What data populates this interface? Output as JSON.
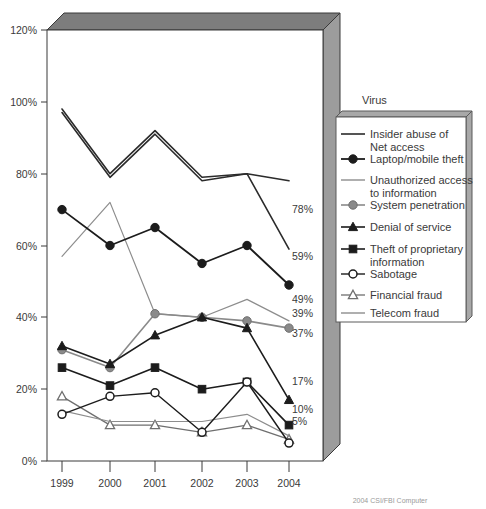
{
  "chart_data": {
    "type": "line",
    "title": "",
    "xlabel": "",
    "ylabel": "",
    "categories": [
      "1999",
      "2000",
      "2001",
      "2002",
      "2003",
      "2004"
    ],
    "ylim": [
      0,
      120
    ],
    "yticks": [
      0,
      20,
      40,
      60,
      80,
      100,
      120
    ],
    "ytick_labels": [
      "0%",
      "20%",
      "40%",
      "60%",
      "80%",
      "100%",
      "120%"
    ],
    "grid": false,
    "legend_position": "right",
    "legend_title": "Virus",
    "series": [
      {
        "name": "Virus",
        "values": [
          98,
          80,
          92,
          79,
          80,
          78
        ],
        "end_label": "78%",
        "marker": "none",
        "color": "#2b2b2b",
        "width": 1.6
      },
      {
        "name": "Insider abuse of Net access",
        "values": [
          97,
          79,
          91,
          78,
          80,
          59
        ],
        "end_label": "59%",
        "marker": "none",
        "color": "#2b2b2b",
        "width": 1.6
      },
      {
        "name": "Laptop/mobile theft",
        "values": [
          70,
          60,
          65,
          55,
          60,
          49
        ],
        "end_label": "49%",
        "marker": "circle-filled",
        "color": "#1c1c1c",
        "width": 1.8
      },
      {
        "name": "Unauthorized access to information",
        "values": [
          57,
          72,
          41,
          40,
          45,
          39
        ],
        "end_label": "39%",
        "marker": "none",
        "color": "#8d8d8d",
        "width": 1.2
      },
      {
        "name": "System penetration",
        "values": [
          31,
          26,
          41,
          40,
          39,
          37
        ],
        "end_label": "37%",
        "marker": "circle-gray",
        "color": "#8a8a8a",
        "width": 1.6
      },
      {
        "name": "Denial of service",
        "values": [
          32,
          27,
          35,
          40,
          37,
          17
        ],
        "end_label": "17%",
        "marker": "triangle-filled",
        "color": "#1c1c1c",
        "width": 1.6
      },
      {
        "name": "Theft of proprietary information",
        "values": [
          26,
          21,
          26,
          20,
          22,
          10
        ],
        "end_label": "10%",
        "marker": "square-filled",
        "color": "#1c1c1c",
        "width": 1.6
      },
      {
        "name": "Sabotage",
        "values": [
          13,
          18,
          19,
          8,
          22,
          5
        ],
        "end_label": "5%",
        "marker": "circle-open",
        "color": "#1c1c1c",
        "width": 1.4
      },
      {
        "name": "Financial fraud",
        "values": [
          18,
          10,
          10,
          8,
          10,
          6
        ],
        "end_label": "",
        "marker": "triangle-open",
        "color": "#6f6f6f",
        "width": 1.3
      },
      {
        "name": "Telecom fraud",
        "values": [
          14,
          11,
          11,
          11,
          13,
          7
        ],
        "end_label": "",
        "marker": "none",
        "color": "#8d8d8d",
        "width": 1.2
      }
    ],
    "end_labels": [
      {
        "text": "78%",
        "value": 78
      },
      {
        "text": "59%",
        "value": 59
      },
      {
        "text": "49%",
        "value": 49
      },
      {
        "text": "39%",
        "value": 39
      },
      {
        "text": "37%",
        "value": 37
      },
      {
        "text": "17%",
        "value": 17
      },
      {
        "text": "10%",
        "value": 10
      },
      {
        "text": "5%",
        "value": 5
      }
    ]
  },
  "axes": {
    "y_tick_0": "0%",
    "y_tick_20": "20%",
    "y_tick_40": "40%",
    "y_tick_60": "60%",
    "y_tick_80": "80%",
    "y_tick_100": "100%",
    "y_tick_120": "120%",
    "x_tick_1": "1999",
    "x_tick_2": "2000",
    "x_tick_3": "2001",
    "x_tick_4": "2002",
    "x_tick_5": "2003",
    "x_tick_6": "2004"
  },
  "end_labels": {
    "l1": "78%",
    "l2": "59%",
    "l3": "49%",
    "l4": "39%",
    "l5": "37%",
    "l6": "17%",
    "l7": "10%",
    "l8": "5%"
  },
  "legend": {
    "title": "Virus",
    "items": [
      {
        "label_line1": "Insider abuse of",
        "label_line2": "Net access"
      },
      {
        "label_line1": "Laptop/mobile theft",
        "label_line2": ""
      },
      {
        "label_line1": "Unauthorized access",
        "label_line2": "to information"
      },
      {
        "label_line1": "System penetration",
        "label_line2": ""
      },
      {
        "label_line1": "Denial of service",
        "label_line2": ""
      },
      {
        "label_line1": "Theft of proprietary",
        "label_line2": "information"
      },
      {
        "label_line1": "Sabotage",
        "label_line2": ""
      },
      {
        "label_line1": "Financial fraud",
        "label_line2": ""
      },
      {
        "label_line1": "Telecom fraud",
        "label_line2": ""
      }
    ]
  },
  "footer": {
    "note": "2004 CSI/FBI Computer"
  },
  "colors": {
    "plot_border": "#3a3a3a",
    "plot_side_3d": "#8e8e8e",
    "plot_top_3d": "#767676",
    "text": "#3a3a3a",
    "gray_series": "#8d8d8d",
    "dark_series": "#1c1c1c"
  }
}
